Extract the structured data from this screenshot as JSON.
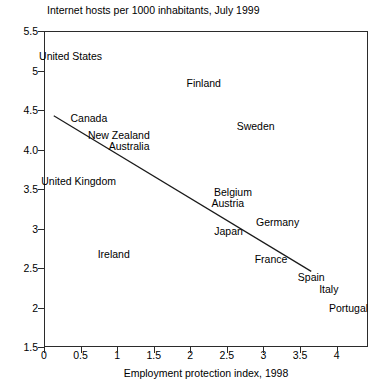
{
  "chart_data": {
    "type": "scatter",
    "title": "Internet hosts per 1000 inhabitants, July 1999",
    "xlabel": "Employment protection index, 1998",
    "ylabel": "",
    "xlim": [
      0,
      4.43
    ],
    "ylim": [
      1.5,
      5.5
    ],
    "grid": false,
    "legend": "none",
    "xticks": [
      "0",
      "0.5",
      "1",
      "1.5",
      "2",
      "2.5",
      "3",
      "3.5",
      "4"
    ],
    "xtick_values": [
      0,
      0.5,
      1,
      1.5,
      2,
      2.5,
      3,
      3.5,
      4
    ],
    "yticks": [
      "5.5",
      "5",
      "4.5",
      "4.0",
      "3.5",
      "3",
      "2.5",
      "2",
      "1.5"
    ],
    "ytick_values": [
      5.5,
      5,
      4.5,
      4.0,
      3.5,
      3,
      2.5,
      2,
      1.5
    ],
    "point_label_note": "Countries are shown as text labels only; no marker symbols are drawn.",
    "points": [
      {
        "label": "United States",
        "x": 0.35,
        "y": 5.2
      },
      {
        "label": "Finland",
        "x": 2.17,
        "y": 4.85
      },
      {
        "label": "Canada",
        "x": 0.6,
        "y": 4.41
      },
      {
        "label": "Sweden",
        "x": 2.88,
        "y": 4.31
      },
      {
        "label": "New Zealand",
        "x": 1.01,
        "y": 4.2
      },
      {
        "label": "Australia",
        "x": 1.15,
        "y": 4.06
      },
      {
        "label": "United Kingdom",
        "x": 0.46,
        "y": 3.62
      },
      {
        "label": "Belgium",
        "x": 2.57,
        "y": 3.48
      },
      {
        "label": "Austria",
        "x": 2.5,
        "y": 3.34
      },
      {
        "label": "Germany",
        "x": 3.18,
        "y": 3.09
      },
      {
        "label": "Japan",
        "x": 2.51,
        "y": 2.98
      },
      {
        "label": "Ireland",
        "x": 0.94,
        "y": 2.69
      },
      {
        "label": "France",
        "x": 3.09,
        "y": 2.63
      },
      {
        "label": "Spain",
        "x": 3.64,
        "y": 2.4
      },
      {
        "label": "Italy",
        "x": 3.88,
        "y": 2.25
      },
      {
        "label": "Portugal",
        "x": 4.15,
        "y": 2.01
      }
    ],
    "trendline": {
      "x0": 0.12,
      "y0": 4.44,
      "x1": 3.64,
      "y1": 2.47
    },
    "colors": {
      "axis": "#2b2b2b",
      "text": "#000000",
      "trendline": "#1a1a1a",
      "background": "#ffffff"
    }
  }
}
